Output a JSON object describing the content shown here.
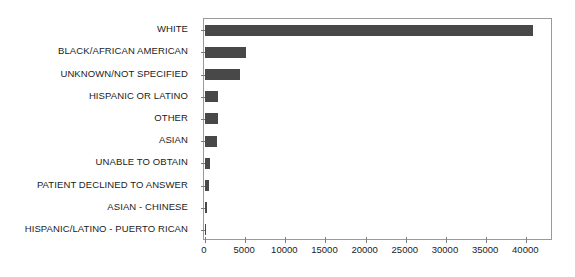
{
  "chart_data": {
    "type": "bar",
    "orientation": "horizontal",
    "title": "",
    "xlabel": "",
    "ylabel": "",
    "grid": false,
    "legend": null,
    "xlim": [
      0,
      43200
    ],
    "xticks": [
      0,
      5000,
      10000,
      15000,
      20000,
      25000,
      30000,
      35000,
      40000
    ],
    "xticklabels": [
      "0",
      "5000",
      "10000",
      "15000",
      "20000",
      "25000",
      "30000",
      "35000",
      "40000"
    ],
    "bar_color": "#484848",
    "categories": [
      "WHITE",
      "BLACK/AFRICAN AMERICAN",
      "UNKNOWN/NOT SPECIFIED",
      "HISPANIC OR LATINO",
      "OTHER",
      "ASIAN",
      "UNABLE TO OBTAIN",
      "PATIENT DECLINED TO ANSWER",
      "ASIAN - CHINESE",
      "HISPANIC/LATINO - PUERTO RICAN"
    ],
    "values": [
      40870,
      5080,
      4330,
      1650,
      1560,
      1540,
      620,
      480,
      190,
      180
    ]
  }
}
